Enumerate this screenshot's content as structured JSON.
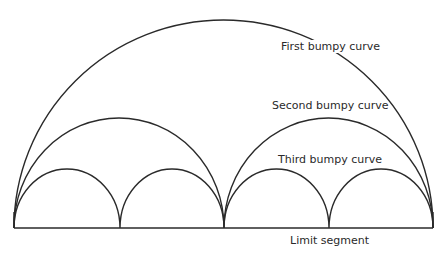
{
  "diagram": {
    "stroke_color": "#2a2a2a",
    "background": "#ffffff",
    "labels": {
      "first": "First bumpy curve",
      "second": "Second bumpy curve",
      "third": "Third bumpy curve",
      "limit": "Limit segment"
    },
    "curves": [
      {
        "name": "first",
        "arcs": 1
      },
      {
        "name": "second",
        "arcs": 2
      },
      {
        "name": "third",
        "arcs": 4
      }
    ]
  }
}
